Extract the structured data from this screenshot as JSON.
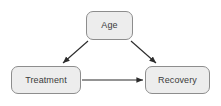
{
  "diagram": {
    "background_color": "#ffffff",
    "node_fill_color": "#ededed",
    "node_border_color": "#8d8d8d",
    "node_text_color": "#3b3b3b",
    "edge_color": "#2b2b2b",
    "nodes": [
      {
        "id": "age",
        "label": "Age"
      },
      {
        "id": "treatment",
        "label": "Treatment"
      },
      {
        "id": "recovery",
        "label": "Recovery"
      }
    ],
    "edges": [
      {
        "id": "age-to-treatment",
        "from": "Age",
        "to": "Treatment",
        "arrow": "single"
      },
      {
        "id": "age-to-recovery",
        "from": "Age",
        "to": "Recovery",
        "arrow": "single"
      },
      {
        "id": "treatment-to-recovery",
        "from": "Treatment",
        "to": "Recovery",
        "arrow": "single"
      }
    ]
  }
}
